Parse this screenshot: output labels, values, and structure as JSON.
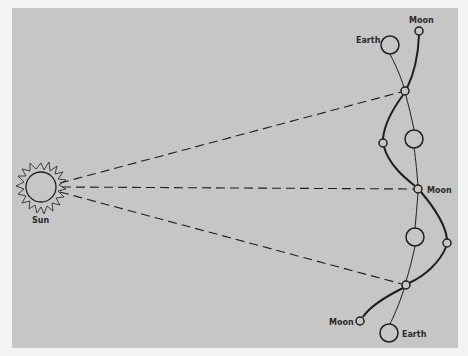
{
  "diagram": {
    "labels": {
      "sun": "Sun",
      "earth_top": "Earth",
      "moon_top": "Moon",
      "moon_middle": "Moon",
      "moon_bottom": "Moon",
      "earth_bottom": "Earth"
    },
    "colors": {
      "background": "#c6c6c6",
      "page": "#f3f3f3",
      "stroke": "#1e1e1e",
      "circle_fill": "#c6c6c6"
    }
  }
}
